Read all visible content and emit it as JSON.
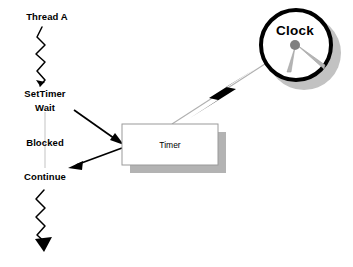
{
  "diagram": {
    "background_color": "#ffffff",
    "thread_lane": {
      "name": "Thread A",
      "labels": [
        {
          "id": "thread-a",
          "text": "Thread A",
          "x": 47,
          "y": 16
        },
        {
          "id": "settimer",
          "text": "SetTimer",
          "x": 45,
          "y": 93
        },
        {
          "id": "wait",
          "text": "Wait",
          "x": 45,
          "y": 107
        },
        {
          "id": "blocked",
          "text": "Blocked",
          "x": 45,
          "y": 142
        },
        {
          "id": "continue",
          "text": "Continue",
          "x": 45,
          "y": 176
        }
      ],
      "lifeline_color": "#d5d5d5"
    },
    "timer_box": {
      "label": "Timer",
      "x": 122,
      "y": 124,
      "width": 96,
      "height": 41,
      "fill": "#ffffff",
      "border_color": "#9a9a9a",
      "shadow_color": "#b3b3b3",
      "shadow_offset": 8
    },
    "clock": {
      "label": "Clock",
      "center_x": 296,
      "center_y": 45,
      "radius": 37,
      "ring_color": "#000000",
      "ring_width": 4,
      "face_fill": "#ffffff",
      "hub_color": "#808080",
      "hand_color": "#a0a0a0",
      "shadow_color": "#c2c2c2",
      "shadow_offset": 8
    },
    "connectors": [
      {
        "id": "wait-to-timer",
        "from": "Wait",
        "to": "Timer",
        "style": "solid-arrow",
        "color": "#000000"
      },
      {
        "id": "timer-to-continue",
        "from": "Timer",
        "to": "Continue",
        "style": "solid-arrow",
        "color": "#000000"
      },
      {
        "id": "clock-to-timer",
        "from": "Clock",
        "to": "Timer",
        "style": "thin-line-with-lightning",
        "color": "#b0b0b0"
      },
      {
        "id": "thread-zigzag-top",
        "from": "Thread A",
        "to": "SetTimer",
        "style": "zigzag-arrow",
        "color": "#000000"
      },
      {
        "id": "thread-zigzag-bottom",
        "from": "Continue",
        "to": "end",
        "style": "zigzag-arrow",
        "color": "#000000"
      }
    ],
    "lightning_bolt": {
      "id": "timer-fire-event",
      "color": "#000000"
    }
  }
}
